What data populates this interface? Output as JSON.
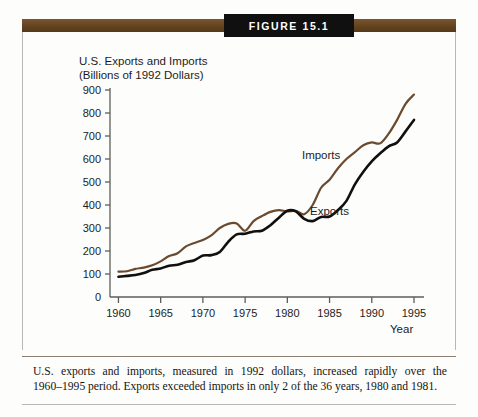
{
  "figure": {
    "tab_label": "Figure 15.1",
    "caption_line1": "U.S. exports and imports, measured in 1992 dollars, increased rapidly over the",
    "caption_line2": "1960–1995 period. Exports exceeded imports in only 2 of the 36 years, 1980 and 1981."
  },
  "colors": {
    "banner_brown": "#6b4a28",
    "tab_black": "#111010",
    "imports_line": "#6b4a2e",
    "exports_line": "#12100e",
    "axis": "#5d5d58",
    "frame": "#b9b9b4"
  },
  "chart_data": {
    "type": "line",
    "title": "U.S. Exports and Imports",
    "subtitle": "(Billions of 1992 Dollars)",
    "ylabel_line1": "U.S. Exports and Imports",
    "ylabel_line2": "(Billions of 1992 Dollars)",
    "xlabel": "Year",
    "ylim": [
      0,
      900
    ],
    "xlim": [
      1959,
      1995
    ],
    "grid": false,
    "legend_position": "inline-annotation",
    "yticks": [
      0,
      100,
      200,
      300,
      400,
      500,
      600,
      700,
      800,
      900
    ],
    "ytick_labels": [
      "0",
      "100",
      "200",
      "300",
      "400",
      "500",
      "600",
      "700",
      "800",
      "900"
    ],
    "xticks": [
      1960,
      1965,
      1970,
      1975,
      1980,
      1985,
      1990,
      1995
    ],
    "xtick_labels": [
      "1960",
      "1965",
      "1970",
      "1975",
      "1980",
      "1985",
      "1990",
      "1995"
    ],
    "x": [
      1960,
      1961,
      1962,
      1963,
      1964,
      1965,
      1966,
      1967,
      1968,
      1969,
      1970,
      1971,
      1972,
      1973,
      1974,
      1975,
      1976,
      1977,
      1978,
      1979,
      1980,
      1981,
      1982,
      1983,
      1984,
      1985,
      1986,
      1987,
      1988,
      1989,
      1990,
      1991,
      1992,
      1993,
      1994,
      1995
    ],
    "series": [
      {
        "name": "Imports",
        "color": "#6b4a2e",
        "label_x": 1984,
        "label_y": 600,
        "values": [
          110,
          112,
          122,
          128,
          138,
          155,
          178,
          190,
          220,
          235,
          248,
          268,
          300,
          318,
          320,
          288,
          330,
          352,
          370,
          378,
          372,
          375,
          360,
          400,
          475,
          510,
          560,
          600,
          630,
          660,
          672,
          668,
          710,
          770,
          840,
          880
        ]
      },
      {
        "name": "Exports",
        "color": "#12100e",
        "label_x": 1985,
        "label_y": 355,
        "values": [
          88,
          92,
          96,
          104,
          118,
          124,
          136,
          140,
          152,
          160,
          180,
          182,
          196,
          240,
          272,
          275,
          285,
          288,
          312,
          345,
          375,
          372,
          340,
          330,
          348,
          350,
          378,
          418,
          490,
          545,
          590,
          625,
          655,
          672,
          720,
          770
        ]
      }
    ],
    "annotations": [
      {
        "text": "Imports",
        "series": "Imports"
      },
      {
        "text": "Exports",
        "series": "Exports"
      }
    ]
  }
}
